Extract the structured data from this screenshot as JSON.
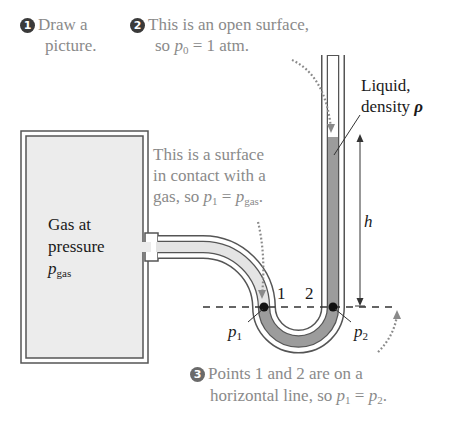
{
  "steps": {
    "step1": {
      "number": "1",
      "line1": "Draw a",
      "line2": "picture."
    },
    "step2": {
      "number": "2",
      "line1": "This is an open surface,",
      "line2_prefix": "so ",
      "symbol": "p",
      "sub": "0",
      "line2_suffix": " = 1 atm."
    },
    "step3": {
      "number": "3",
      "line1": "Points 1 and 2 are on a",
      "line2_prefix": "horizontal line, so ",
      "sym_a": "p",
      "sub_a": "1",
      "equals": " = ",
      "sym_b": "p",
      "sub_b": "2",
      "end": "."
    }
  },
  "annotations": {
    "gas_surface": {
      "line1": "This is a surface",
      "line2": "in contact with a",
      "line3_prefix": "gas, so ",
      "sym_a": "p",
      "sub_a": "1",
      "equals": " = ",
      "sym_b": "p",
      "sub_b": "gas",
      "end": "."
    },
    "liquid": {
      "line1": "Liquid,",
      "line2_prefix": "density ",
      "symbol": "ρ"
    },
    "gas_box": {
      "line1": "Gas at",
      "line2": "pressure",
      "symbol": "p",
      "sub": "gas"
    },
    "height": "h",
    "point1": "1",
    "point2": "2",
    "p1_label": {
      "symbol": "p",
      "sub": "1"
    },
    "p2_label": {
      "symbol": "p",
      "sub": "2"
    }
  },
  "colors": {
    "text_grey": "#8a8a8a",
    "line": "#444444",
    "liquid": "#9c9c9c",
    "gas_fill": "#ececec",
    "tube_gas": "#e4e4e4"
  }
}
